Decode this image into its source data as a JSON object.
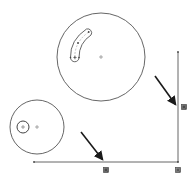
{
  "sketch": {
    "background": "#ffffff",
    "line_color": "#555555",
    "arrow_color": "#1a1a1a",
    "marker_color": "#4a4a4a",
    "big_circle": {
      "cx": 101,
      "cy": 57,
      "r": 44
    },
    "slot": {
      "start": [
        71,
        57
      ],
      "end": [
        88,
        30
      ],
      "width": 8
    },
    "small_circle": {
      "cx": 37,
      "cy": 127,
      "r": 27
    },
    "inner_circle": {
      "cx": 23,
      "cy": 127,
      "r": 6
    },
    "vertical_line": {
      "x": 178,
      "y1": 52,
      "y2": 162
    },
    "horizontal_line": {
      "y": 162,
      "x1": 34,
      "x2": 178
    },
    "relation_markers": [
      {
        "name": "vertical-relation",
        "x": 184,
        "y": 107
      },
      {
        "name": "horizontal-relation",
        "x": 106,
        "y": 170
      },
      {
        "name": "coincident-relation",
        "x": 178,
        "y": 170
      }
    ],
    "arrows": [
      {
        "name": "arrow-to-vertical-line",
        "from": [
          155,
          76
        ],
        "to": [
          176,
          105
        ]
      },
      {
        "name": "arrow-to-horizontal-line",
        "from": [
          81,
          132
        ],
        "to": [
          103,
          160
        ]
      }
    ]
  }
}
